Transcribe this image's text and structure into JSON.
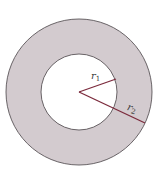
{
  "diagram": {
    "type": "annulus",
    "colors": {
      "background": "#ffffff",
      "ring_fill": "#d3cbcf",
      "circle_stroke": "#5a5558",
      "radius_line": "#7b2a3c"
    },
    "center": {
      "x": 79,
      "y": 92
    },
    "outer_radius": 73,
    "inner_radius": 38,
    "radii": [
      {
        "name": "r1",
        "label": "r",
        "subscript": "1",
        "end": {
          "x": 116,
          "y": 79
        }
      },
      {
        "name": "r2",
        "label": "r",
        "subscript": "2",
        "end": {
          "x": 145,
          "y": 123
        }
      }
    ]
  }
}
